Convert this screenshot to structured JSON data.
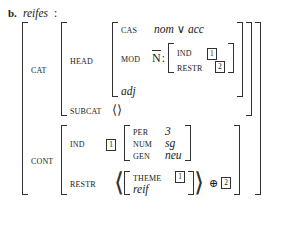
{
  "example": {
    "letter": "b.",
    "lexeme": "reifes",
    "colon": ":"
  },
  "symbols": {
    "disjunction": "∨",
    "append": "⊕",
    "angle_open": "⟨",
    "angle_close": "⟩",
    "empty_list_open": "⟨",
    "empty_list_close": "⟩",
    "nbar": "N"
  },
  "avm": {
    "attributes": {
      "cat": "CAT",
      "cont": "CONT",
      "head": "HEAD",
      "subcat": "SUBCAT",
      "cas": "CAS",
      "mod": "MOD",
      "ind": "IND",
      "restr": "RESTR",
      "per": "PER",
      "num": "NUM",
      "gen": "GEN",
      "theme": "THEME"
    },
    "values": {
      "cas": "nom ∨ acc",
      "mod_category": "N",
      "head_type": "adj",
      "subcat_list": "⟨⟩",
      "per": "3",
      "num": "sg",
      "gen": "neu",
      "restr_type": "reif"
    },
    "tags": {
      "mod_ind": "1",
      "mod_restr": "2",
      "cont_ind": "1",
      "theme": "1",
      "append_tag": "2"
    }
  }
}
